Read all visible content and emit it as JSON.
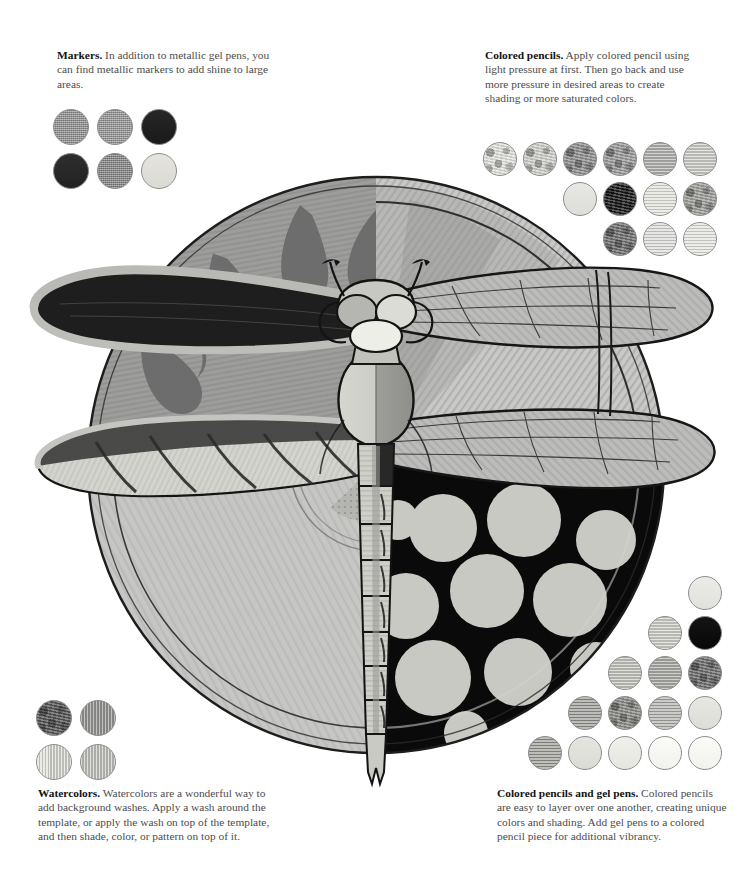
{
  "page": {
    "background": "#ffffff"
  },
  "notes": {
    "markers": {
      "heading": "Markers.",
      "body": " In addition to metallic gel pens, you can find metallic markers to add shine to large areas."
    },
    "colored_pencils": {
      "heading": "Colored pencils.",
      "body": " Apply colored pencil using light pressure at first. Then go back and use more pressure in desired areas to create shading or more saturated colors."
    },
    "watercolors": {
      "heading": "Watercolors.",
      "body": " Watercolors are a wonderful way to add background washes. Apply a wash around the template, or apply the wash on top of the template, and then shade, color, or pattern on top of it."
    },
    "colored_pencils_and_gel_pens": {
      "heading": "Colored pencils and gel pens.",
      "body": " Colored pencils are easy to layer over one another, creating unique colors and shading. Add gel pens to a colored pencil piece for additional vibrancy."
    }
  },
  "swatches": {
    "markers": {
      "label": "marker swatches",
      "size": 36,
      "gap": 8,
      "rows": [
        [
          {
            "name": "swatch-marker-1",
            "color": "#8c8c8c",
            "texture": "tx-grain"
          },
          {
            "name": "swatch-marker-2",
            "color": "#919191",
            "texture": "tx-grain"
          },
          {
            "name": "swatch-marker-3",
            "color": "#1b1b1b",
            "texture": "tx-flat"
          }
        ],
        [
          {
            "name": "swatch-marker-4",
            "color": "#232323",
            "texture": "tx-flat"
          },
          {
            "name": "swatch-marker-5",
            "color": "#7e7e7e",
            "texture": "tx-grain"
          },
          {
            "name": "swatch-marker-6",
            "color": "#e3e3dc",
            "texture": "tx-flat"
          }
        ]
      ]
    },
    "colored_pencils": {
      "label": "colored pencil swatches",
      "size": 34,
      "gap": 6,
      "rows": [
        [
          {
            "name": "swatch-pencil-1",
            "color": "#e0e0dc",
            "texture": "tx-mottle"
          },
          {
            "name": "swatch-pencil-2",
            "color": "#cfcfcb",
            "texture": "tx-mottle"
          },
          {
            "name": "swatch-pencil-3",
            "color": "#8f8f8f",
            "texture": "tx-mottle"
          },
          {
            "name": "swatch-pencil-4",
            "color": "#9a9a9a",
            "texture": "tx-mottle"
          },
          {
            "name": "swatch-pencil-5",
            "color": "#b6b6b4",
            "texture": "tx-horiz"
          },
          {
            "name": "swatch-pencil-6",
            "color": "#d2d2cf",
            "texture": "tx-horiz"
          }
        ],
        [
          {
            "name": "swatch-pencil-7",
            "color": "#e6e6e2",
            "texture": "tx-flat"
          },
          {
            "name": "swatch-pencil-8",
            "color": "#1c1c1c",
            "texture": "tx-mottle"
          },
          {
            "name": "swatch-pencil-9",
            "color": "#dcdcd7",
            "texture": "tx-horiz"
          },
          {
            "name": "swatch-pencil-10",
            "color": "#9d9d9a",
            "texture": "tx-mottle"
          }
        ],
        [
          {
            "name": "swatch-pencil-11",
            "color": "#6f6f6f",
            "texture": "tx-mottle"
          },
          {
            "name": "swatch-pencil-12",
            "color": "#d5d5d1",
            "texture": "tx-horiz"
          },
          {
            "name": "swatch-pencil-13",
            "color": "#dededa",
            "texture": "tx-horiz"
          }
        ]
      ]
    },
    "watercolors": {
      "label": "watercolor swatches",
      "size": 36,
      "gap": 8,
      "rows": [
        [
          {
            "name": "swatch-water-1",
            "color": "#555555",
            "texture": "tx-mottle"
          },
          {
            "name": "swatch-water-2",
            "color": "#9a9a98",
            "texture": "tx-vert"
          }
        ],
        [
          {
            "name": "swatch-water-3",
            "color": "#dcdcd6",
            "texture": "tx-vert"
          },
          {
            "name": "swatch-water-4",
            "color": "#c8c8c4",
            "texture": "tx-vert"
          }
        ]
      ]
    },
    "colored_pencils_and_gel_pens": {
      "label": "colored pencil and gel pen swatches",
      "size": 34,
      "gap": 6,
      "rows": [
        [
          {
            "name": "swatch-gel-1",
            "color": "#eaeae6",
            "texture": "tx-flat"
          }
        ],
        [
          {
            "name": "swatch-gel-2",
            "color": "#d3d3cd",
            "texture": "tx-horiz"
          },
          {
            "name": "swatch-gel-3",
            "color": "#080808",
            "texture": "tx-flat"
          }
        ],
        [
          {
            "name": "swatch-gel-4",
            "color": "#c9c9c3",
            "texture": "tx-horiz"
          },
          {
            "name": "swatch-gel-5",
            "color": "#aeaeaa",
            "texture": "tx-horiz"
          },
          {
            "name": "swatch-gel-6",
            "color": "#6e6e6e",
            "texture": "tx-mottle"
          }
        ],
        [
          {
            "name": "swatch-gel-7",
            "color": "#8d8d8a",
            "texture": "tx-horiz"
          },
          {
            "name": "swatch-gel-8",
            "color": "#8a8a86",
            "texture": "tx-mottle"
          },
          {
            "name": "swatch-gel-9",
            "color": "#a6a6a2",
            "texture": "tx-horiz"
          },
          {
            "name": "swatch-gel-10",
            "color": "#e6e6e1",
            "texture": "tx-flat"
          }
        ],
        [
          {
            "name": "swatch-gel-11",
            "color": "#8f8f8b",
            "texture": "tx-horiz"
          },
          {
            "name": "swatch-gel-12",
            "color": "#e4e4de",
            "texture": "tx-flat"
          },
          {
            "name": "swatch-gel-13",
            "color": "#efefea",
            "texture": "tx-flat"
          },
          {
            "name": "swatch-gel-14",
            "color": "#fbfbf8",
            "texture": "tx-flat"
          },
          {
            "name": "swatch-gel-15",
            "color": "#fbfbf8",
            "texture": "tx-flat"
          }
        ]
      ]
    }
  },
  "artwork": {
    "subject": "dragonfly",
    "circle": {
      "center_x": 376,
      "center_y": 465,
      "radius": 290,
      "quadrants": [
        {
          "name": "top-left",
          "style": "flame-teardrops",
          "base_color": "#9a9a9a",
          "motif_color": "#6b6b6b"
        },
        {
          "name": "top-right",
          "style": "radial-pencil-strokes",
          "base_color": "#c6c6c4"
        },
        {
          "name": "bottom-left",
          "style": "light-wash",
          "base_color": "#c2c2c0"
        },
        {
          "name": "bottom-right",
          "style": "polka-dots",
          "base_color": "#0a0a0a",
          "motif_color": "#c9c9c4"
        }
      ]
    },
    "dragonfly": {
      "wings_upper_left": {
        "fill": "#1a1a1a",
        "rim": "#b4b4b2"
      },
      "wings_lower_left": {
        "fill": "#d2d2cd",
        "stripes": "#3a3a3a"
      },
      "wings_right": {
        "fill": "#bcbcba",
        "veins": "#2a2a2a"
      },
      "thorax": {
        "left": "#cfcfca",
        "right": "#9b9b98"
      },
      "abdomen_segments": 8,
      "head": {
        "eyes": "#b9b9b5",
        "face": "#e6e6e1"
      },
      "antennae": 2
    }
  }
}
